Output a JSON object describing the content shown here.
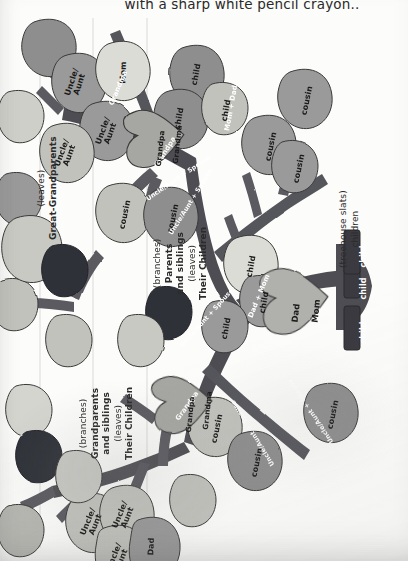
{
  "page": {
    "caption": "with a sharp white pencil crayon..",
    "orientation": "rotated-90"
  },
  "colors": {
    "branch_dark": "#4a4a50",
    "branch_mid": "#5a5a60",
    "leaf_mid": "#8e8e8e",
    "leaf_light": "#c9c9c4",
    "leaf_pale": "#dcdcd6",
    "leaf_dark": "#2e3038",
    "heart": "#a6a6a2",
    "slat": "#3a3a40",
    "paper": "#fcfcfa",
    "ink": "#1b1b1b",
    "guide_line": "#cfcfcf"
  },
  "sections": [
    {
      "id": "great-grandparents",
      "lines": [
        "(leaves)",
        "Great-Grandparents"
      ]
    },
    {
      "id": "parents",
      "lines": [
        "(branches)",
        "Parents",
        "and siblings",
        "(leaves)",
        "Their Children"
      ]
    },
    {
      "id": "grandparents",
      "lines": [
        "(branches)",
        "Grandparents",
        "and siblings",
        "(leaves)",
        "Their Children"
      ]
    },
    {
      "id": "treehouse",
      "lines": [
        "(treehouse slats)",
        "children"
      ]
    }
  ],
  "leaves": [
    {
      "id": "l01",
      "text": "",
      "tone": "mid"
    },
    {
      "id": "l02",
      "text": "",
      "tone": "pale"
    },
    {
      "id": "l03",
      "text": "Uncle/\nAunt",
      "tone": "mid"
    },
    {
      "id": "l04",
      "text": "Mom",
      "tone": "pale"
    },
    {
      "id": "l05",
      "text": "Uncle/\nAunt",
      "tone": "mid"
    },
    {
      "id": "l06",
      "text": "Uncle/\nAunt",
      "tone": "mid"
    },
    {
      "id": "l07",
      "text": "Uncle/\nAunt",
      "tone": "light"
    },
    {
      "id": "l08",
      "text": "",
      "tone": "pale"
    },
    {
      "id": "l09",
      "text": "",
      "tone": "mid"
    },
    {
      "id": "l10",
      "text": "",
      "tone": "light"
    },
    {
      "id": "l11",
      "text": "",
      "tone": "dark"
    },
    {
      "id": "l12",
      "text": "",
      "tone": "dark"
    },
    {
      "id": "l13",
      "text": "",
      "tone": "pale"
    },
    {
      "id": "l14",
      "text": "",
      "tone": "light"
    },
    {
      "id": "l15",
      "text": "Uncle/\nAunt",
      "tone": "light"
    },
    {
      "id": "l16",
      "text": "Uncle/\nAunt",
      "tone": "light"
    },
    {
      "id": "l17",
      "text": "Uncle/\nAunt",
      "tone": "light"
    },
    {
      "id": "l18",
      "text": "Dad",
      "tone": "mid"
    },
    {
      "id": "l19",
      "text": "child",
      "tone": "mid"
    },
    {
      "id": "l20",
      "text": "child",
      "tone": "mid"
    },
    {
      "id": "l21",
      "text": "child",
      "tone": "light"
    },
    {
      "id": "l22",
      "text": "cousin",
      "tone": "mid"
    },
    {
      "id": "l23",
      "text": "cousin",
      "tone": "mid"
    },
    {
      "id": "l24",
      "text": "cousin",
      "tone": "mid"
    },
    {
      "id": "l25",
      "text": "cousin",
      "tone": "light"
    },
    {
      "id": "l26",
      "text": "cousin",
      "tone": "mid"
    },
    {
      "id": "l27",
      "text": "child",
      "tone": "pale"
    },
    {
      "id": "l28",
      "text": "child",
      "tone": "mid"
    },
    {
      "id": "l29",
      "text": "child",
      "tone": "mid"
    },
    {
      "id": "l30",
      "text": "cousin",
      "tone": "light"
    },
    {
      "id": "l31",
      "text": "cousin",
      "tone": "mid"
    },
    {
      "id": "l32",
      "text": "cousin",
      "tone": "mid"
    }
  ],
  "branch_labels": [
    {
      "id": "b01",
      "text": "Grandma"
    },
    {
      "id": "b02",
      "text": "Grandpa"
    },
    {
      "id": "b03",
      "text": "Grandpa"
    },
    {
      "id": "b04",
      "text": "Mom + Dad"
    },
    {
      "id": "b05",
      "text": "Dad + Mom"
    },
    {
      "id": "b06",
      "text": "Uncle/Aunt + Spouse"
    },
    {
      "id": "b07",
      "text": "Uncle/Aunt + Spouse"
    },
    {
      "id": "b08",
      "text": "Uncle/Aunt + Spouse"
    },
    {
      "id": "b09",
      "text": "Uncle/Aunt + Spouse"
    },
    {
      "id": "b10",
      "text": "Uncle/Aunt + Spouse"
    }
  ],
  "hearts": [
    {
      "id": "h1",
      "left": "Grandpa",
      "right": "Grandma"
    },
    {
      "id": "h2",
      "left": "Grandpa",
      "right": "Grandma"
    },
    {
      "id": "h3",
      "left": "Dad",
      "right": "Mom"
    }
  ],
  "slats": [
    {
      "id": "s1",
      "text": "child"
    },
    {
      "id": "s2",
      "text": "child"
    },
    {
      "id": "s3",
      "text": "child"
    }
  ]
}
